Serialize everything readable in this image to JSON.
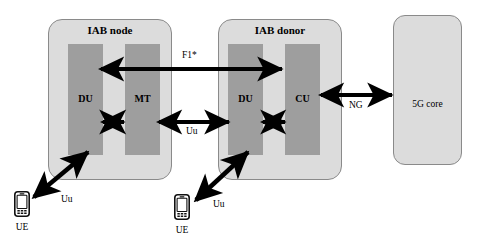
{
  "figure": {
    "type": "architecture-diagram",
    "cropped_caption_fragment": ""
  },
  "nodes": {
    "iab_node": {
      "title": "IAB node",
      "units": [
        {
          "id": "du",
          "label": "DU"
        },
        {
          "id": "mt",
          "label": "MT"
        }
      ]
    },
    "iab_donor": {
      "title": "IAB donor",
      "units": [
        {
          "id": "du",
          "label": "DU"
        },
        {
          "id": "cu",
          "label": "CU"
        }
      ]
    },
    "core": {
      "label": "5G core"
    }
  },
  "endpoints": {
    "ue_left": {
      "label": "UE",
      "icon": "smartphone-icon"
    },
    "ue_right": {
      "label": "UE",
      "icon": "smartphone-icon"
    }
  },
  "links": [
    {
      "id": "f1star",
      "label": "F1*",
      "from": "iab_node.du",
      "to": "iab_donor.du",
      "arrow": "double"
    },
    {
      "id": "uu_backhaul",
      "label": "Uu",
      "from": "iab_node.mt",
      "to": "iab_donor.du",
      "arrow": "double"
    },
    {
      "id": "ng",
      "label": "NG",
      "from": "iab_donor.cu",
      "to": "core",
      "arrow": "double"
    },
    {
      "id": "node_internal",
      "label": "",
      "from": "iab_node.du",
      "to": "iab_node.mt",
      "arrow": "double"
    },
    {
      "id": "donor_internal",
      "label": "",
      "from": "iab_donor.du",
      "to": "iab_donor.cu",
      "arrow": "double"
    },
    {
      "id": "uu_access_left",
      "label": "Uu",
      "from": "ue_left",
      "to": "iab_node.du",
      "arrow": "double"
    },
    {
      "id": "uu_access_right",
      "label": "Uu",
      "from": "ue_right",
      "to": "iab_donor.du",
      "arrow": "double"
    }
  ],
  "colors": {
    "outer_box_fill": "#dcdcdc",
    "outer_box_stroke": "#8a8a8a",
    "unit_fill": "#9e9e9e",
    "arrow": "#000000",
    "background": "#ffffff"
  }
}
